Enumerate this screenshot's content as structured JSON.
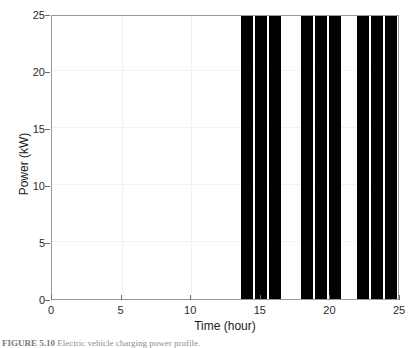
{
  "figure": {
    "caption_label": "FIGURE 5.10",
    "caption_text": "Electric vehicle charging power profile."
  },
  "chart_data": {
    "type": "bar",
    "title": "",
    "xlabel": "Time (hour)",
    "ylabel": "Power (kW)",
    "xlim": [
      0,
      25
    ],
    "ylim": [
      0,
      25
    ],
    "xticks": [
      0,
      5,
      10,
      15,
      20,
      25
    ],
    "yticks": [
      0,
      5,
      10,
      15,
      20,
      25
    ],
    "xtick_labels": [
      "0",
      "5",
      "10",
      "15",
      "20",
      "25"
    ],
    "ytick_labels": [
      "0",
      "5",
      "10",
      "15",
      "20",
      "25"
    ],
    "grid": true,
    "legend": "none",
    "bar_color": "#000000",
    "background_color": "#ffffff",
    "axis_color": "#9a9a9a",
    "bars": [
      {
        "x_start": 13.55,
        "x_end": 14.45,
        "value": 24.8
      },
      {
        "x_start": 14.6,
        "x_end": 15.45,
        "value": 24.8
      },
      {
        "x_start": 15.6,
        "x_end": 16.45,
        "value": 24.8
      },
      {
        "x_start": 17.9,
        "x_end": 18.75,
        "value": 24.8
      },
      {
        "x_start": 18.9,
        "x_end": 19.75,
        "value": 24.8
      },
      {
        "x_start": 19.9,
        "x_end": 20.75,
        "value": 24.8
      },
      {
        "x_start": 21.9,
        "x_end": 22.75,
        "value": 24.8
      },
      {
        "x_start": 22.9,
        "x_end": 23.75,
        "value": 24.8
      },
      {
        "x_start": 23.9,
        "x_end": 24.75,
        "value": 24.8
      }
    ]
  }
}
